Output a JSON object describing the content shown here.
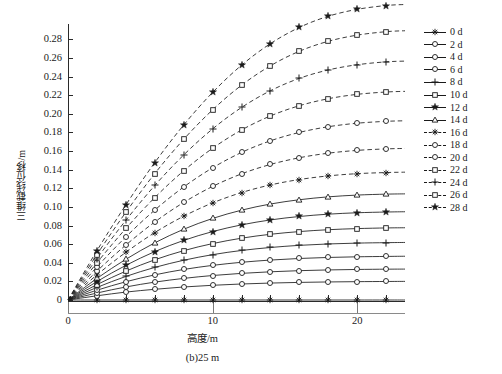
{
  "chart_data": {
    "type": "line",
    "title": "",
    "subtitle": "",
    "caption": "(b)25 m",
    "xlabel": "高度/m",
    "ylabel": "三维截线位移/m",
    "xlim": [
      0,
      23.3
    ],
    "ylim": [
      0,
      0.29
    ],
    "xticks": [
      0,
      10,
      20
    ],
    "xtick_labels": [
      "0",
      "10",
      "20"
    ],
    "xminor_step": 2,
    "yticks": [
      0,
      0.02,
      0.04,
      0.06,
      0.08,
      0.1,
      0.12,
      0.14,
      0.16,
      0.18,
      0.2,
      0.22,
      0.24,
      0.26,
      0.28
    ],
    "ytick_labels": [
      "0",
      "0.02",
      "0.04",
      "0.06",
      "0.08",
      "0.10",
      "0.12",
      "0.14",
      "0.16",
      "0.18",
      "0.20",
      "0.22",
      "0.24",
      "0.26",
      "0.28"
    ],
    "grid": false,
    "legend_position": "right",
    "x": [
      0,
      2,
      4,
      6,
      8,
      10,
      12,
      14,
      16,
      18,
      20,
      22,
      23.3
    ],
    "series": [
      {
        "name": "0 d",
        "marker": "asterisk",
        "linestyle": "solid",
        "values": [
          0,
          0,
          0,
          0,
          0,
          0,
          0,
          0,
          0,
          0,
          0,
          0,
          0
        ]
      },
      {
        "name": "2 d",
        "marker": "circle",
        "linestyle": "solid",
        "values": [
          0,
          0.0045,
          0.0085,
          0.0115,
          0.014,
          0.0158,
          0.0172,
          0.0182,
          0.0189,
          0.0194,
          0.0197,
          0.0199,
          0.02
        ]
      },
      {
        "name": "4 d",
        "marker": "circle",
        "linestyle": "solid",
        "values": [
          0,
          0.0075,
          0.014,
          0.0192,
          0.0232,
          0.0263,
          0.0286,
          0.0303,
          0.0315,
          0.0323,
          0.0328,
          0.0331,
          0.0332
        ]
      },
      {
        "name": "6 d",
        "marker": "circle",
        "linestyle": "solid",
        "values": [
          0,
          0.0105,
          0.0196,
          0.027,
          0.0328,
          0.0372,
          0.0405,
          0.0429,
          0.0446,
          0.0457,
          0.0464,
          0.0468,
          0.047
        ]
      },
      {
        "name": "8 d",
        "marker": "plus",
        "linestyle": "solid",
        "values": [
          0,
          0.0135,
          0.0253,
          0.035,
          0.0427,
          0.0487,
          0.0532,
          0.0564,
          0.0587,
          0.0602,
          0.0611,
          0.0616,
          0.0618
        ]
      },
      {
        "name": "10 d",
        "marker": "square",
        "linestyle": "solid",
        "values": [
          0,
          0.0165,
          0.031,
          0.0432,
          0.053,
          0.0606,
          0.0664,
          0.0706,
          0.0735,
          0.0755,
          0.0767,
          0.0774,
          0.0776
        ]
      },
      {
        "name": "12 d",
        "marker": "star-filled",
        "linestyle": "solid",
        "values": [
          0,
          0.0198,
          0.0372,
          0.052,
          0.064,
          0.0735,
          0.0807,
          0.086,
          0.0897,
          0.0922,
          0.0937,
          0.0945,
          0.0948
        ]
      },
      {
        "name": "14 d",
        "marker": "triangle",
        "linestyle": "solid",
        "values": [
          0,
          0.0232,
          0.0437,
          0.0614,
          0.076,
          0.0876,
          0.0965,
          0.1031,
          0.1077,
          0.1108,
          0.1127,
          0.1137,
          0.114
        ]
      },
      {
        "name": "16 d",
        "marker": "asterisk",
        "linestyle": "dashed",
        "values": [
          0,
          0.027,
          0.0512,
          0.0724,
          0.09,
          0.1043,
          0.1154,
          0.1236,
          0.1294,
          0.1333,
          0.1357,
          0.1369,
          0.1373
        ]
      },
      {
        "name": "18 d",
        "marker": "circle",
        "linestyle": "dashed",
        "values": [
          0,
          0.031,
          0.059,
          0.0838,
          0.1048,
          0.122,
          0.1355,
          0.1456,
          0.1528,
          0.1577,
          0.1607,
          0.1623,
          0.1628
        ]
      },
      {
        "name": "20 d",
        "marker": "circle",
        "linestyle": "dashed",
        "values": [
          0,
          0.0355,
          0.0678,
          0.0966,
          0.1214,
          0.142,
          0.1585,
          0.171,
          0.18,
          0.1861,
          0.1899,
          0.1919,
          0.1925
        ]
      },
      {
        "name": "22 d",
        "marker": "square",
        "linestyle": "dashed",
        "values": [
          0,
          0.04,
          0.0768,
          0.11,
          0.1388,
          0.163,
          0.1826,
          0.1977,
          0.2087,
          0.2162,
          0.2209,
          0.2234,
          0.2241
        ]
      },
      {
        "name": "24 d",
        "marker": "plus",
        "linestyle": "dashed",
        "values": [
          0,
          0.0445,
          0.0856,
          0.123,
          0.1558,
          0.1838,
          0.2068,
          0.2248,
          0.2381,
          0.2471,
          0.2527,
          0.2558,
          0.2566
        ]
      },
      {
        "name": "26 d",
        "marker": "square",
        "linestyle": "dashed",
        "values": [
          0,
          0.0488,
          0.0942,
          0.1358,
          0.1726,
          0.2043,
          0.2307,
          0.2516,
          0.2672,
          0.2779,
          0.2845,
          0.2882,
          0.2892
        ]
      },
      {
        "name": "28 d",
        "marker": "star-filled",
        "linestyle": "dashed",
        "values": [
          0,
          0.053,
          0.1022,
          0.1476,
          0.188,
          0.223,
          0.2522,
          0.2754,
          0.2928,
          0.3048,
          0.3122,
          0.3163,
          0.3174
        ]
      }
    ]
  }
}
